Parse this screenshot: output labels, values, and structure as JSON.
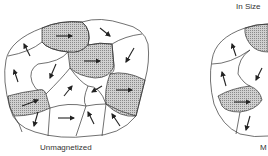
{
  "diagram": {
    "top_caption_partial": "In Size",
    "panels": [
      {
        "label": "Unmagnetized",
        "domains": [
          {
            "shaded": true,
            "arrow": "right"
          },
          {
            "shaded": false,
            "arrow": "down-right"
          },
          {
            "shaded": true,
            "arrow": "right"
          },
          {
            "shaded": false,
            "arrow": "down-left"
          },
          {
            "shaded": false,
            "arrow": "up-left"
          },
          {
            "shaded": false,
            "arrow": "up-left"
          },
          {
            "shaded": false,
            "arrow": "down-left"
          },
          {
            "shaded": false,
            "arrow": "up-right"
          },
          {
            "shaded": false,
            "arrow": "down-left"
          },
          {
            "shaded": true,
            "arrow": "right"
          },
          {
            "shaded": true,
            "arrow": "right"
          },
          {
            "shaded": false,
            "arrow": "down-left"
          },
          {
            "shaded": false,
            "arrow": "right"
          },
          {
            "shaded": false,
            "arrow": "up-left"
          },
          {
            "shaded": false,
            "arrow": "up-left"
          }
        ]
      },
      {
        "label": "M",
        "label_partial": true,
        "domains": [
          {
            "shaded": true,
            "arrow": "right"
          },
          {
            "shaded": false,
            "arrow": "up-left"
          },
          {
            "shaded": false,
            "arrow": "up-left"
          },
          {
            "shaded": false,
            "arrow": "down-left"
          },
          {
            "shaded": true,
            "arrow": "right"
          },
          {
            "shaded": false,
            "arrow": "down-left"
          }
        ]
      }
    ],
    "colors": {
      "outline": "#333333",
      "shade": "#b8b8b8",
      "arrow": "#222222"
    }
  }
}
